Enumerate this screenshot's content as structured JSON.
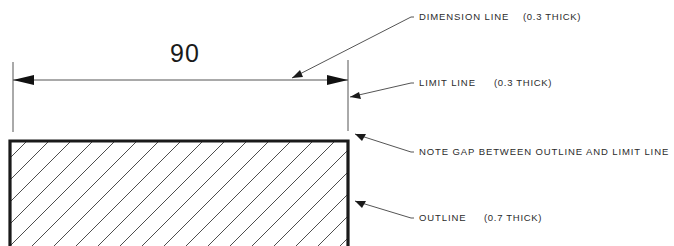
{
  "drawing": {
    "title": "Drafting line-type convention illustration",
    "dimension": {
      "value": "90",
      "value_x": 185,
      "value_y": 62
    },
    "annotations": [
      {
        "id": "dimension-line",
        "label": "DIMENSION LINE",
        "spec": "(0.3 THICK)",
        "label_x": 419,
        "label_y": 17,
        "spec_x": 523,
        "spec_y": 17,
        "leader": "M 292 78 L 411 17 L 414 17",
        "arrow": "292,78 303,77 300,70"
      },
      {
        "id": "limit-line",
        "label": "LIMIT LINE",
        "spec": "(0.3 THICK)",
        "label_x": 419,
        "label_y": 83,
        "spec_x": 494,
        "spec_y": 83,
        "leader": "M 350 97 L 411 83 L 414 83",
        "arrow": "350,97 361,99 359,92"
      },
      {
        "id": "note-gap",
        "label": "NOTE GAP BETWEEN OUTLINE AND LIMIT LINE",
        "spec": "",
        "label_x": 419,
        "label_y": 152,
        "spec_x": 0,
        "spec_y": 0,
        "leader": "M 355 134 L 411 152 L 414 152",
        "arrow": "355,134 366,134 362,141"
      },
      {
        "id": "outline",
        "label": "OUTLINE",
        "spec": "(0.7 THICK)",
        "label_x": 419,
        "label_y": 218,
        "spec_x": 484,
        "spec_y": 218,
        "leader": "M 355 201 L 411 218 L 414 218",
        "arrow": "355,201 366,201 362,208"
      }
    ],
    "dimension_line": {
      "y": 80,
      "x_start": 13,
      "x_end": 348,
      "left_arrow": "13,80 34,75 34,85",
      "right_arrow": "348,80 327,75 327,85"
    },
    "limit_lines": [
      {
        "id": "left-limit-line",
        "x": 13,
        "y_top": 62,
        "y_bottom": 132
      },
      {
        "id": "right-limit-line",
        "x": 348,
        "y_top": 60,
        "y_bottom": 131
      }
    ],
    "outline_shape": {
      "left": 10,
      "right": 348,
      "top": 141,
      "bottom": 246
    },
    "hatch": {
      "angle_deg": 45,
      "spacing": 22,
      "count": 21
    },
    "colors": {
      "ink": "#1a1a1a",
      "thin_ink": "#555555",
      "hatch": "#3a3a3a",
      "background": "#ffffff"
    }
  }
}
